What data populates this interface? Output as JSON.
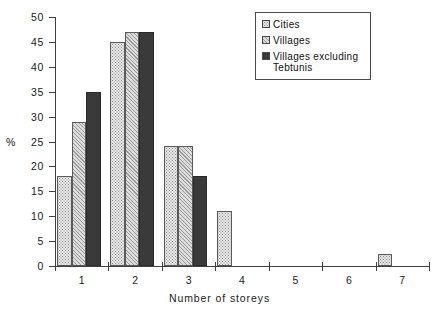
{
  "chart_data": {
    "type": "bar",
    "title": "",
    "xlabel": "Number of storeys",
    "ylabel": "%",
    "categories": [
      "1",
      "2",
      "3",
      "4",
      "5",
      "6",
      "7"
    ],
    "series": [
      {
        "name": "Cities",
        "pattern": "dots",
        "values": [
          18,
          45,
          24,
          11,
          0,
          0,
          2.5
        ]
      },
      {
        "name": "Villages",
        "pattern": "hatch",
        "values": [
          29,
          47,
          24,
          0,
          0,
          0,
          0
        ]
      },
      {
        "name": "Villages excluding Tebtunis",
        "pattern": "solid",
        "values": [
          35,
          47,
          18,
          0,
          0,
          0,
          0
        ]
      }
    ],
    "ylim": [
      0,
      50
    ],
    "yticks": [
      0,
      5,
      10,
      15,
      20,
      25,
      30,
      35,
      40,
      45,
      50
    ],
    "ytick_labels": [
      "0",
      "5",
      "10",
      "15",
      "20",
      "25",
      "30",
      "35",
      "40",
      "45",
      "50"
    ],
    "grid": false,
    "legend_position": "top-right"
  },
  "legend": {
    "entries": [
      {
        "label": "Cities"
      },
      {
        "label": "Villages"
      },
      {
        "label": "Villages excluding\nTebtunis"
      }
    ]
  },
  "axis": {
    "y_unit_label": "%",
    "x_title": "Number of storeys"
  },
  "colors": {
    "series_cities": "#e8e8e8",
    "series_villages": "#d5d5d5",
    "series_villages_excl": "#3a3a3a",
    "axis": "#404040",
    "text": "#1a1a1a"
  }
}
